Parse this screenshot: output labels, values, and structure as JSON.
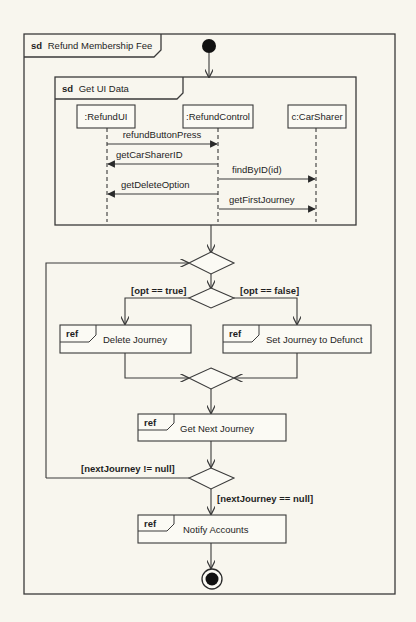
{
  "diagram": {
    "type": "UML interaction overview diagram",
    "outer_frame": {
      "keyword": "sd",
      "title": "Refund Membership Fee"
    },
    "inline_interaction": {
      "keyword": "sd",
      "title": "Get UI Data",
      "lifelines": [
        ":RefundUI",
        ":RefundControl",
        "c:CarSharer"
      ],
      "messages": [
        {
          "label": "refundButtonPress",
          "from": ":RefundUI",
          "to": ":RefundControl"
        },
        {
          "label": "getCarSharerID",
          "from": ":RefundControl",
          "to": ":RefundUI"
        },
        {
          "label": "findByID(id)",
          "from": ":RefundControl",
          "to": "c:CarSharer"
        },
        {
          "label": "getDeleteOption",
          "from": ":RefundControl",
          "to": ":RefundUI"
        },
        {
          "label": "getFirstJourney",
          "from": ":RefundControl",
          "to": "c:CarSharer"
        }
      ]
    },
    "guards": {
      "opt_true": "[opt == true]",
      "opt_false": "[opt == false]",
      "next_not_null": "[nextJourney != null]",
      "next_null": "[nextJourney == null]"
    },
    "refs": [
      {
        "keyword": "ref",
        "label": "Delete Journey"
      },
      {
        "keyword": "ref",
        "label": "Set Journey to Defunct"
      },
      {
        "keyword": "ref",
        "label": "Get Next Journey"
      },
      {
        "keyword": "ref",
        "label": "Notify Accounts"
      }
    ],
    "colors": {
      "background": "#f8f6ee",
      "stroke": "#3a3a3a",
      "text": "#1e1e1e"
    }
  }
}
